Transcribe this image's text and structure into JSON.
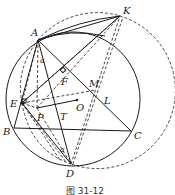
{
  "figure": {
    "caption": "图 31-12",
    "points": {
      "A": {
        "label": "A",
        "x": 38,
        "y": 40
      },
      "K": {
        "label": "K",
        "x": 120,
        "y": 16
      },
      "B": {
        "label": "B",
        "x": 14,
        "y": 128
      },
      "C": {
        "label": "C",
        "x": 131,
        "y": 131
      },
      "D": {
        "label": "D",
        "x": 71,
        "y": 164
      },
      "E": {
        "label": "E",
        "x": 22,
        "y": 103
      },
      "F": {
        "label": "F",
        "x": 65,
        "y": 72
      },
      "M": {
        "label": "M",
        "x": 96,
        "y": 90
      },
      "L": {
        "label": "L",
        "x": 104,
        "y": 97
      },
      "O": {
        "label": "O",
        "x": 77,
        "y": 100
      },
      "P": {
        "label": "P",
        "x": 37,
        "y": 108
      },
      "T": {
        "label": "T",
        "x": 61,
        "y": 108
      }
    },
    "angles": {
      "alpha_A": "α",
      "alpha_D": "α"
    },
    "circles": {
      "circumcircle": {
        "cx": 73,
        "cy": 99,
        "r": 68,
        "style": "solid"
      },
      "auxiliary": {
        "cx": 116,
        "cy": 92,
        "r": 77,
        "style": "dashed"
      }
    }
  }
}
